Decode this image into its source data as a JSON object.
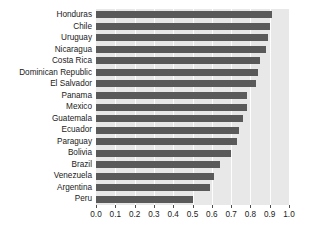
{
  "chart_data": {
    "type": "bar",
    "orientation": "horizontal",
    "title": "",
    "subtitle": "",
    "xlabel": "",
    "ylabel": "",
    "xlim": [
      0.0,
      1.0
    ],
    "xticks": [
      "0.0",
      "0.1",
      "0.2",
      "0.3",
      "0.4",
      "0.5",
      "0.6",
      "0.7",
      "0.8",
      "0.9",
      "1.0"
    ],
    "xtick_values": [
      0.0,
      0.1,
      0.2,
      0.3,
      0.4,
      0.5,
      0.6,
      0.7,
      0.8,
      0.9,
      1.0
    ],
    "grid": "vertical-white-gridlines",
    "legend": "none",
    "categories": [
      "Honduras",
      "Chile",
      "Uruguay",
      "Nicaragua",
      "Costa Rica",
      "Dominican Republic",
      "El Salvador",
      "Panama",
      "Mexico",
      "Guatemala",
      "Ecuador",
      "Paraguay",
      "Bolivia",
      "Brazil",
      "Venezuela",
      "Argentina",
      "Peru"
    ],
    "values": [
      0.91,
      0.9,
      0.89,
      0.88,
      0.85,
      0.84,
      0.83,
      0.78,
      0.78,
      0.76,
      0.74,
      0.73,
      0.7,
      0.64,
      0.61,
      0.59,
      0.5
    ],
    "colors": {
      "bar": "#5a5a5a",
      "plot_background": "#e8e8e8",
      "gridline": "#fdfdfd",
      "figure_background": "#ffffff",
      "text": "#1a1a1a",
      "tick": "#4d4d4d"
    }
  }
}
